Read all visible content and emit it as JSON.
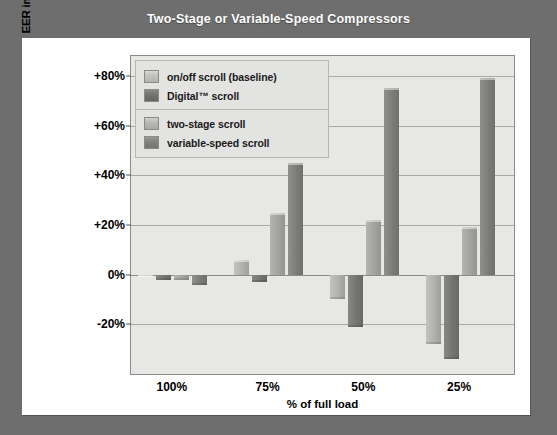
{
  "chart_data": {
    "type": "bar",
    "title": "Two-Stage or Variable-Speed Compressors",
    "xlabel": "% of full load",
    "ylabel": "EER improvement, % of baseline at full load",
    "categories": [
      "100%",
      "75%",
      "50%",
      "25%"
    ],
    "ylim": [
      -40,
      88
    ],
    "yticks": [
      80,
      60,
      40,
      20,
      0,
      -20
    ],
    "ytick_labels": [
      "+80%",
      "+60%",
      "+40%",
      "+20%",
      "0%",
      "-20%"
    ],
    "grid": true,
    "legend_position": "top-left inside plot",
    "series": [
      {
        "name": "on/off scroll (baseline)",
        "color": "#b0b0ae",
        "values": [
          0,
          6,
          -10,
          -28
        ]
      },
      {
        "name": "Digital™ scroll",
        "color": "#75756f",
        "values": [
          -2,
          -3,
          -21,
          -34
        ]
      },
      {
        "name": "two-stage scroll",
        "color": "#a3a3a1",
        "values": [
          -2,
          25,
          22,
          19
        ]
      },
      {
        "name": "variable-speed scroll",
        "color": "#7c7c7a",
        "values": [
          -4,
          45,
          75,
          79
        ]
      }
    ]
  },
  "colors": {
    "page_background": "#6e6e6e",
    "card_background": "#ffffff",
    "plot_background": "#e7e7e5",
    "title_text": "#ffffff",
    "grid": "#a9a9a7"
  }
}
